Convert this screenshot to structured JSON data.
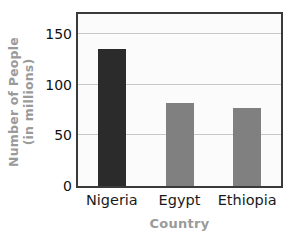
{
  "chart_data": {
    "type": "bar",
    "title": "",
    "categories": [
      "Nigeria",
      "Egypt",
      "Ethiopia"
    ],
    "values": [
      135,
      82,
      77
    ],
    "xlabel": "Country",
    "ylabel": "Number of People (in millions)",
    "ylabel_line1": "Number of People",
    "ylabel_line2": "(in millions)",
    "yticks": [
      0,
      50,
      100,
      150
    ],
    "ytick_labels": [
      "0",
      "50",
      "100",
      "150"
    ],
    "ylim": [
      0,
      170
    ],
    "grid": "horizontal",
    "legend": "none",
    "bar_colors": [
      "#2b2b2b",
      "#808080",
      "#808080"
    ],
    "plot_background": "#fbfbfb",
    "frame_color": "#3a3a3a",
    "gridline_color": "#c8c8c8",
    "axis_title_color": "#9a9a9a",
    "tick_label_color": "#111111"
  }
}
